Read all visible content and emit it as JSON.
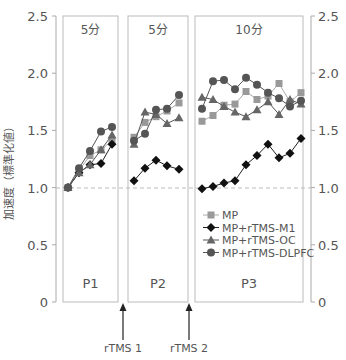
{
  "chart_data": {
    "type": "line",
    "title": "",
    "ylabel": "加速度（標準化値）",
    "ylim": [
      0,
      2.5
    ],
    "yticks": [
      "0",
      "0.5",
      "1.0",
      "1.5",
      "2.0",
      "2.5"
    ],
    "reference_line": 1.0,
    "grid": false,
    "legend_position": "inside-lower-right (P3 panel)",
    "panels": [
      {
        "label": "P1",
        "duration": "5分",
        "x": [
          1,
          2,
          3,
          4,
          5
        ]
      },
      {
        "label": "P2",
        "duration": "5分",
        "x": [
          1,
          2,
          3,
          4,
          5
        ]
      },
      {
        "label": "P3",
        "duration": "10分",
        "x": [
          1,
          2,
          3,
          4,
          5,
          6,
          7,
          8,
          9,
          10
        ]
      }
    ],
    "annotations": [
      "rTMS 1",
      "rTMS 2"
    ],
    "series": [
      {
        "name": "MP",
        "marker": "square",
        "color": "#999999",
        "P1": [
          1.0,
          1.15,
          1.28,
          1.33,
          1.41
        ],
        "P2": [
          1.44,
          1.57,
          1.62,
          1.67,
          1.74
        ],
        "P3": [
          1.58,
          1.63,
          1.72,
          1.73,
          1.84,
          1.77,
          1.8,
          1.91,
          1.75,
          1.83
        ]
      },
      {
        "name": "MP+rTMS-M1",
        "marker": "diamond",
        "color": "#111111",
        "P1": [
          1.0,
          1.13,
          1.2,
          1.21,
          1.38
        ],
        "P2": [
          1.06,
          1.17,
          1.24,
          1.19,
          1.16
        ],
        "P3": [
          0.99,
          1.01,
          1.04,
          1.06,
          1.2,
          1.28,
          1.38,
          1.26,
          1.3,
          1.43
        ]
      },
      {
        "name": "MP+rTMS-OC",
        "marker": "triangle",
        "color": "#666666",
        "P1": [
          1.0,
          1.13,
          1.2,
          1.33,
          1.46
        ],
        "P2": [
          1.38,
          1.66,
          1.64,
          1.56,
          1.61
        ],
        "P3": [
          1.79,
          1.77,
          1.71,
          1.66,
          1.62,
          1.68,
          1.75,
          1.64,
          1.77,
          1.73
        ]
      },
      {
        "name": "MP+rTMS-DLPFC",
        "marker": "circle",
        "color": "#555555",
        "P1": [
          1.0,
          1.17,
          1.32,
          1.49,
          1.53
        ],
        "P2": [
          1.41,
          1.47,
          1.68,
          1.69,
          1.81
        ],
        "P3": [
          1.69,
          1.93,
          1.94,
          1.86,
          1.96,
          1.9,
          1.83,
          1.78,
          1.71,
          1.76
        ]
      }
    ]
  },
  "colors": {
    "axis": "#aaaaaa",
    "panel_border": "#bbbbbb",
    "reference_line": "#bbbbbb",
    "text": "#555555"
  }
}
